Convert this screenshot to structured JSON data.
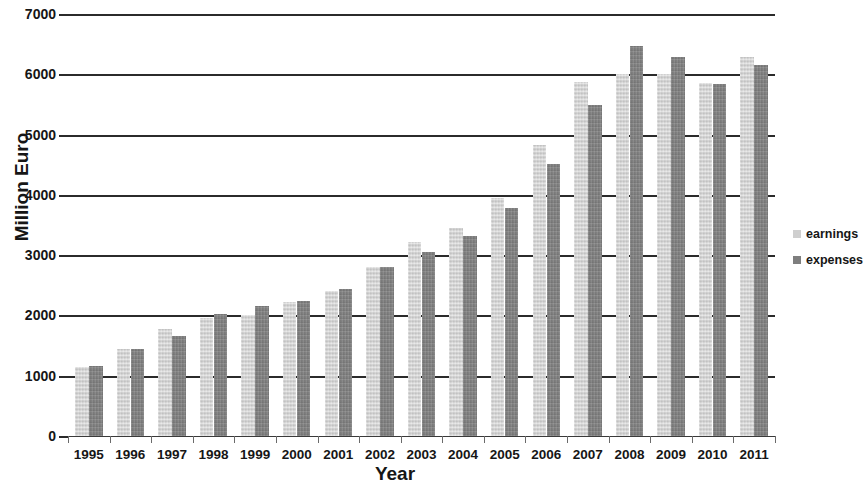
{
  "chart_data": {
    "type": "bar",
    "title": "",
    "xlabel": "Year",
    "ylabel": "Million Euro",
    "ylim": [
      0,
      7000
    ],
    "ytick_step": 1000,
    "yticks": [
      0,
      1000,
      2000,
      3000,
      4000,
      5000,
      6000,
      7000
    ],
    "grid": true,
    "legend_position": "right",
    "categories": [
      "1995",
      "1996",
      "1997",
      "1998",
      "1999",
      "2000",
      "2001",
      "2002",
      "2003",
      "2004",
      "2005",
      "2006",
      "2007",
      "2008",
      "2009",
      "2010",
      "2011"
    ],
    "series": [
      {
        "name": "earnings",
        "color": "#cfcfcf",
        "values": [
          1150,
          1440,
          1780,
          1955,
          2010,
          2220,
          2410,
          2800,
          3210,
          3450,
          3940,
          4820,
          5870,
          6000,
          6010,
          5850,
          6280
        ]
      },
      {
        "name": "expenses",
        "color": "#7e7e7e",
        "values": [
          1165,
          1450,
          1665,
          2030,
          2155,
          2240,
          2440,
          2800,
          3060,
          3320,
          3780,
          4510,
          5490,
          6470,
          6290,
          5840,
          6150
        ]
      }
    ]
  },
  "legend": {
    "items": [
      {
        "label": "earnings",
        "swatch": "earnings-swatch"
      },
      {
        "label": "expenses",
        "swatch": "expenses-swatch"
      }
    ]
  },
  "axes": {
    "y_title": "Million Euro",
    "x_title": "Year"
  }
}
